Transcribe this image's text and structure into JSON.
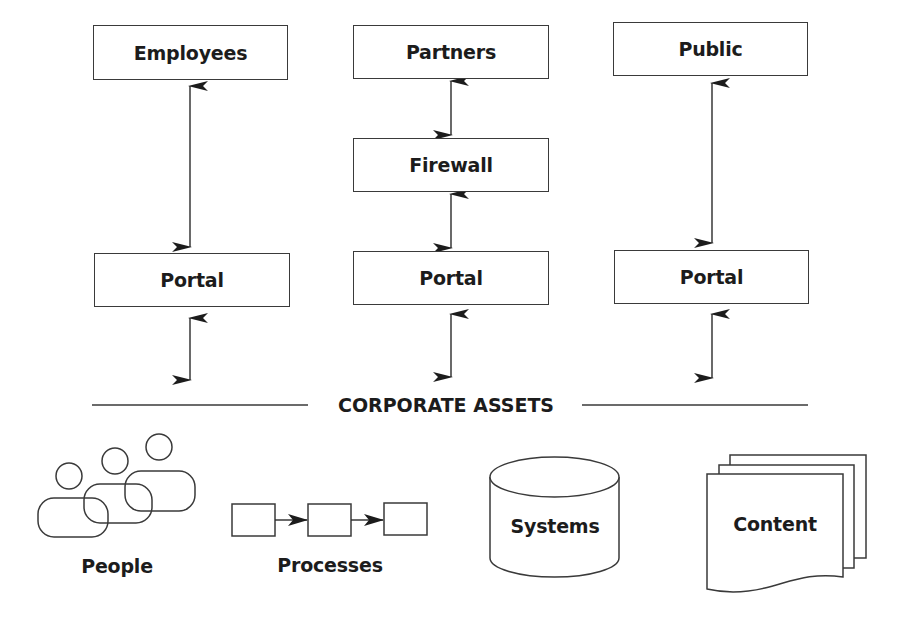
{
  "diagram": {
    "audiences": [
      {
        "label": "Employees"
      },
      {
        "label": "Partners"
      },
      {
        "label": "Public"
      }
    ],
    "firewall": {
      "label": "Firewall"
    },
    "portals": [
      {
        "label": "Portal"
      },
      {
        "label": "Portal"
      },
      {
        "label": "Portal"
      }
    ],
    "section_heading": "CORPORATE ASSETS",
    "assets": [
      {
        "label": "People",
        "icon": "people-icon"
      },
      {
        "label": "Processes",
        "icon": "process-flow-icon"
      },
      {
        "label": "Systems",
        "icon": "database-cylinder-icon"
      },
      {
        "label": "Content",
        "icon": "document-stack-icon"
      }
    ],
    "colors": {
      "stroke": "#3a3a3a",
      "text": "#1c1c1c",
      "background": "#ffffff"
    }
  }
}
